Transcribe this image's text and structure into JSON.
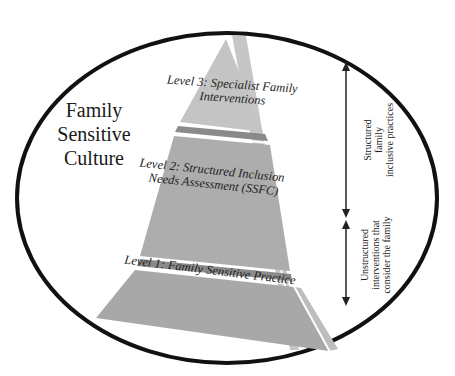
{
  "diagram": {
    "culture_label": [
      "Family",
      "Sensitive",
      "Culture"
    ],
    "levels": [
      {
        "id": "level-3",
        "label_lines": [
          "Level 3: Specialist Family",
          "Interventions"
        ]
      },
      {
        "id": "level-2",
        "label_lines": [
          "Level 2: Structured Inclusion",
          "Needs Assessment (SSFC)"
        ]
      },
      {
        "id": "level-1",
        "label_lines": [
          "Level 1: Family Sensitive Practice"
        ]
      }
    ],
    "side_annotations": [
      {
        "id": "structured",
        "lines": [
          "Structured",
          "family",
          "inclusive practices"
        ]
      },
      {
        "id": "unstructured",
        "lines": [
          "Unstructured",
          "interventions that",
          "consider the family"
        ]
      }
    ],
    "colors": {
      "ellipse_stroke": "#111111",
      "pyramid_front": "#a9a9a9",
      "pyramid_side": "#c6c6c6",
      "pyramid_top_tier": "#c9c9c9",
      "separator_dark": "#7a7a7a",
      "arrow": "#222222"
    }
  }
}
